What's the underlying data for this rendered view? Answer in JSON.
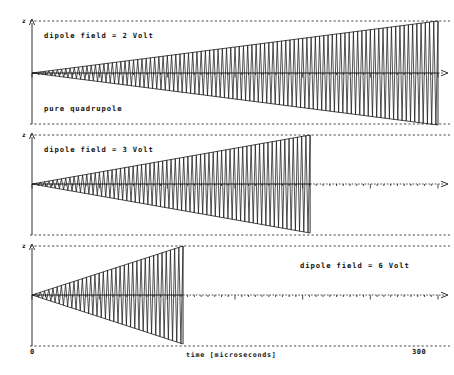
{
  "figure": {
    "background_color": "#ffffff",
    "ink_color": "#1a1a1a",
    "y_axis_label": "z",
    "x_axis_label": "time  [microseconds]",
    "x_tick_labels": {
      "left": "0",
      "right": "300"
    }
  },
  "panels": [
    {
      "id": "panel-2-volt",
      "label": "dipole field = 2 Volt",
      "label_position": "top-left",
      "sub_label": "pure quadrupole",
      "dipole_field_volt": 2,
      "survival_fraction": 1.0,
      "end_time_us": 300,
      "growth_rate": 1.0,
      "cycles": 96,
      "show_arrow": false
    },
    {
      "id": "panel-3-volt",
      "label": "dipole field = 3 Volt",
      "label_position": "top-left",
      "sub_label": "",
      "dipole_field_volt": 3,
      "survival_fraction": 0.685,
      "end_time_us": 205,
      "growth_rate": 1.46,
      "cycles": 66,
      "show_arrow": true
    },
    {
      "id": "panel-6-volt",
      "label": "dipole field = 6 Volt",
      "label_position": "top-right",
      "sub_label": "",
      "dipole_field_volt": 6,
      "survival_fraction": 0.372,
      "end_time_us": 112,
      "growth_rate": 2.69,
      "cycles": 36,
      "show_arrow": true
    }
  ],
  "chart_data": {
    "type": "line",
    "title": "",
    "xlabel": "time  [microseconds]",
    "ylabel": "z",
    "xlim": [
      0,
      300
    ],
    "ylim": [
      -1,
      1
    ],
    "grid": false,
    "legend": "none",
    "x_ticks": [
      0,
      300
    ],
    "series": [
      {
        "name": "dipole field = 2 Volt",
        "panel": 0,
        "annotation": "pure quadrupole",
        "envelope": "linear",
        "x_start": 0,
        "x_end": 300,
        "amplitude_at_end": 1.0,
        "oscillation_cycles": 96
      },
      {
        "name": "dipole field = 3 Volt",
        "panel": 1,
        "annotation": "",
        "envelope": "linear",
        "x_start": 0,
        "x_end": 205,
        "amplitude_at_end": 1.0,
        "oscillation_cycles": 66
      },
      {
        "name": "dipole field = 6 Volt",
        "panel": 2,
        "annotation": "",
        "envelope": "linear",
        "x_start": 0,
        "x_end": 112,
        "amplitude_at_end": 1.0,
        "oscillation_cycles": 36
      }
    ]
  }
}
